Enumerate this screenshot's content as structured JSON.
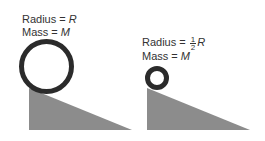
{
  "left": {
    "radius_label": "Radius = ",
    "radius_value": "R",
    "mass_label": "Mass = ",
    "mass_value": "M",
    "ring": {
      "cx": 46.5,
      "cy": 66.5,
      "r": 25,
      "stroke": 5
    },
    "incline": {
      "points": "29,88 29,130 132,130"
    }
  },
  "right": {
    "radius_label": "Radius = ",
    "radius_num": "1",
    "radius_den": "2",
    "radius_value": "R",
    "mass_label": "Mass = ",
    "mass_value": "M",
    "ring": {
      "cx": 157,
      "cy": 78,
      "r": 9.5,
      "stroke": 5
    },
    "incline": {
      "points": "147,88 147,130 250,130"
    }
  },
  "colors": {
    "ring": "#2b2b2b",
    "incline": "#8c8c8c",
    "text": "#333333"
  }
}
